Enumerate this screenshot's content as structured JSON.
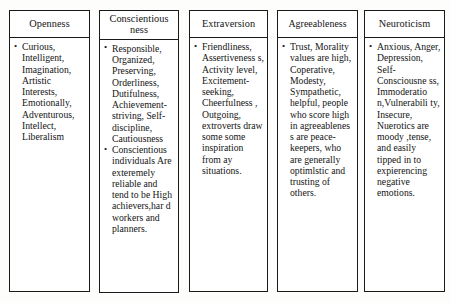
{
  "document": {
    "kind": "table",
    "title_visible": false,
    "column_count": 5,
    "colors": {
      "page_background": "#fdfdfc",
      "cell_background": "#ffffff",
      "border": "#1a1a1a",
      "text": "#141414"
    }
  },
  "table": {
    "columns": [
      {
        "id": "openness",
        "header": "Openness",
        "bullets": [
          "Curious, Intelligent, Imagination, Artistic Interests, Emotionally, Adventurous, Intellect, Liberalism"
        ]
      },
      {
        "id": "conscientiousness",
        "header": "Conscientious ness",
        "bullets": [
          "Responsible, Organized, Preserving, Orderliness, Dutifulness, Achievement-striving, Self-discipline, Cautiousness",
          "Conscientious individuals Are exteremely reliable and tend to be High achievers,har d workers and planners."
        ]
      },
      {
        "id": "extraversion",
        "header": "Extraversion",
        "bullets": [
          "Friendliness, Assertiveness s, Activity level, Excitement-seeking, Cheerfulness , Outgoing, extroverts draw some some inspiration from ay situations."
        ]
      },
      {
        "id": "agreeableness",
        "header": "Agreeableness",
        "bullets": [
          "Trust, Morality values are high, Coperative, Modesty, Sympathetic, helpful, people who score high in agreeablenes s are peace-keepers, who are generally optimlstic and trusting of others."
        ]
      },
      {
        "id": "neuroticism",
        "header": "Neuroticism",
        "bullets": [
          "Anxious, Anger, Depression, Self-Consciousne ss, Immoderatio n,Vulnerabili ty, Insecure, Nuerotics are moody ,tense, and easily tipped in to expierencing negative emotions."
        ]
      }
    ]
  }
}
